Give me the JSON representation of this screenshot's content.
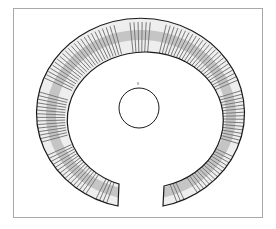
{
  "figure": {
    "subject": "Penannular ribbed bracelet (line drawing)",
    "frame_color": "#a8a8a8",
    "line_color": "#1a1a1a",
    "background": "#ffffff",
    "marker_label": "'"
  }
}
